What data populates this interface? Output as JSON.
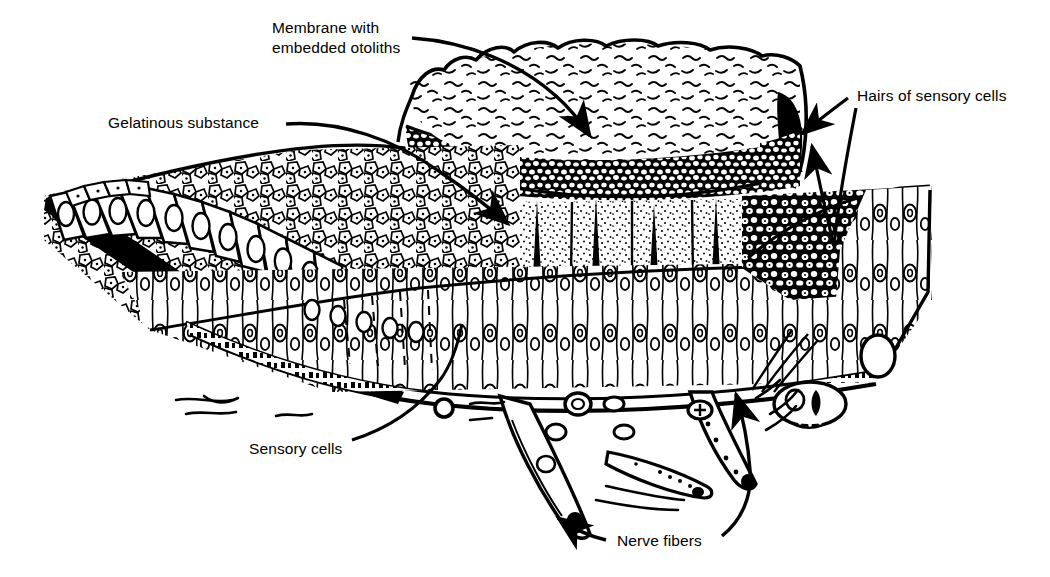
{
  "figure": {
    "title": "Membrane with embedded otoliths",
    "background_color": "#ffffff",
    "ink_color": "#000000"
  },
  "labels": [
    {
      "id": "membrane-otoliths",
      "line1": "Membrane with",
      "line2": "embedded otoliths",
      "x": 272,
      "y": 33,
      "anchor": "start"
    },
    {
      "id": "gelatinous-substance",
      "line1": "Gelatinous substance",
      "line2": "",
      "x": 108,
      "y": 128,
      "anchor": "start"
    },
    {
      "id": "hairs-of-sensory-cells",
      "line1": "Hairs of sensory cells",
      "line2": "",
      "x": 857,
      "y": 101,
      "anchor": "start"
    },
    {
      "id": "sensory-cells",
      "line1": "Sensory cells",
      "line2": "",
      "x": 249,
      "y": 454,
      "anchor": "start"
    },
    {
      "id": "nerve-fibers",
      "line1": "Nerve fibers",
      "line2": "",
      "x": 617,
      "y": 546,
      "anchor": "start"
    }
  ]
}
